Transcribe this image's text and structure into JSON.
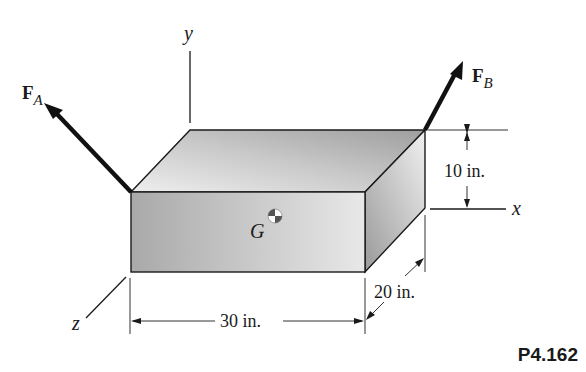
{
  "figure": {
    "problem_id": "P4.162",
    "axes": {
      "x": "x",
      "y": "y",
      "z": "z"
    },
    "forces": [
      {
        "name": "F",
        "subscript": "A"
      },
      {
        "name": "F",
        "subscript": "B"
      }
    ],
    "center_of_gravity": {
      "label": "G"
    },
    "dimensions": {
      "length": "30 in.",
      "height": "10 in.",
      "depth": "20 in."
    },
    "colors": {
      "stroke": "#1a1a1a",
      "front_face_dark": "#a9a9a9",
      "front_face_light": "#e6e6e6",
      "top_face_dark": "#a0a0a0",
      "top_face_light": "#ececec",
      "side_face_dark": "#9a9a9a",
      "side_face_light": "#eeeeee"
    }
  }
}
